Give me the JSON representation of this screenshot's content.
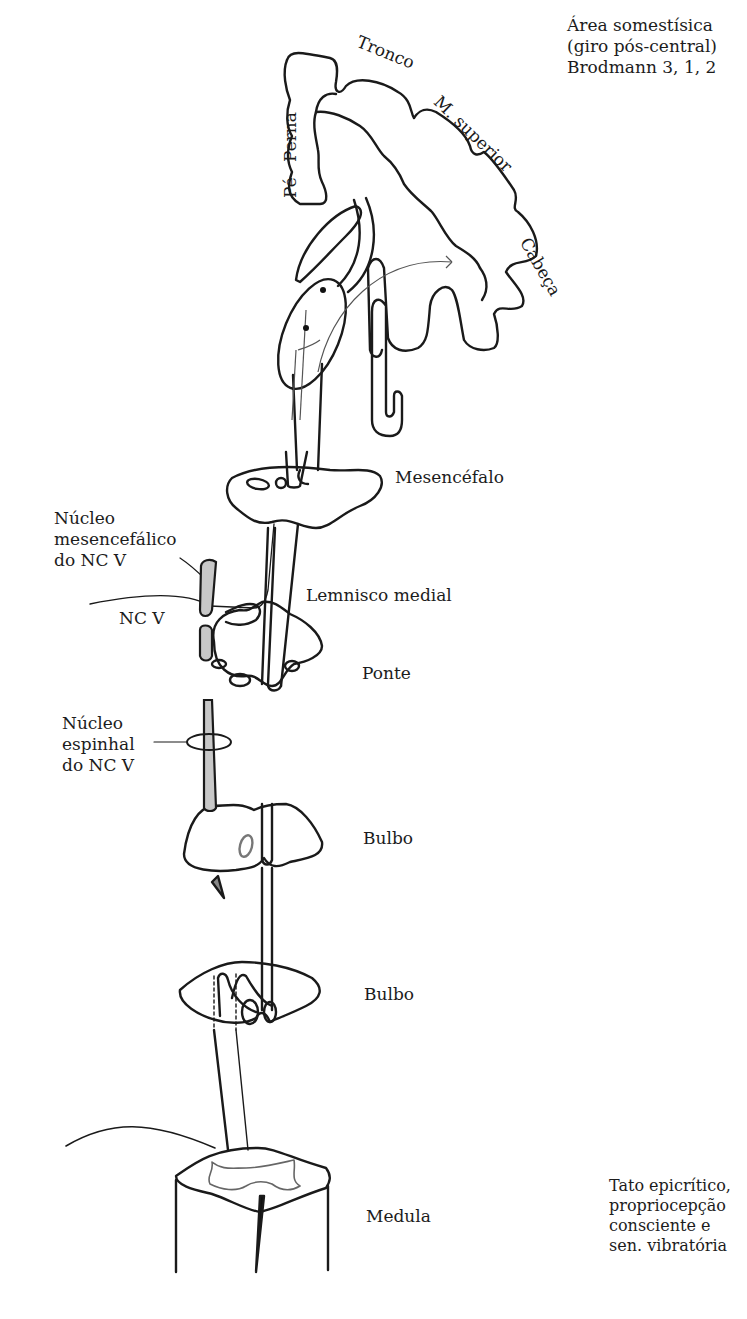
{
  "diagram": {
    "type": "anatomical pathway (dorsal column – medial lemniscus)",
    "cortex_area_label": [
      "Área somestísica",
      "(giro pós-central)",
      "Brodmann 3, 1, 2"
    ],
    "homunculus_labels": {
      "foot": "Pé",
      "leg": "Perna",
      "trunk": "Tronco",
      "upper_limb": "M. superior",
      "head": "Cabeça"
    },
    "levels": {
      "midbrain": "Mesencéfalo",
      "medial_lemniscus": "Lemnisco medial",
      "pons": "Ponte",
      "medulla_upper": "Bulbo",
      "medulla_lower": "Bulbo",
      "spinal_cord": "Medula"
    },
    "trigeminal_labels": {
      "mesencephalic_nucleus": [
        "Núcleo",
        "mesencefálico",
        "do NC V"
      ],
      "nerve": "NC V",
      "spinal_nucleus": [
        "Núcleo",
        "espinhal",
        "do NC V"
      ]
    },
    "modalities": [
      "Tato epicrítico,",
      "propriocepção",
      "consciente e",
      "sen. vibratória"
    ],
    "colors": {
      "line": "#1a1a1a",
      "nucleus_fill": "#c8c8c8",
      "thin_line": "#555555"
    }
  }
}
